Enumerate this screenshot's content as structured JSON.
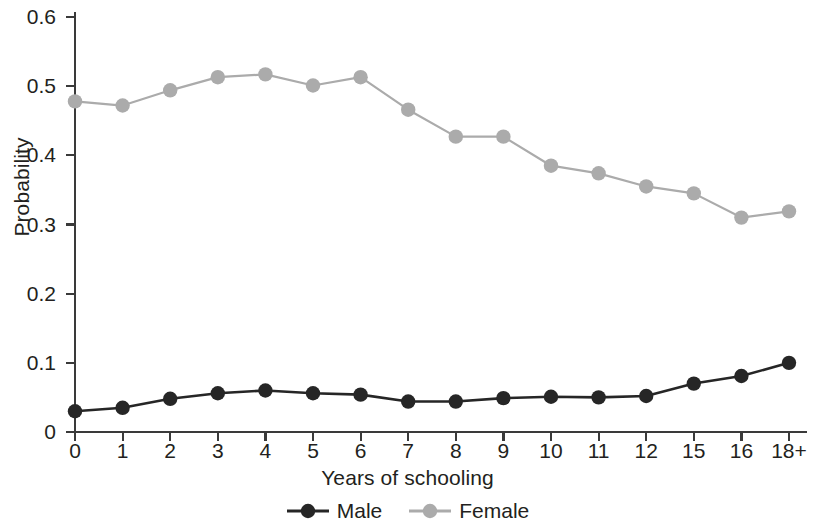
{
  "chart_data": {
    "type": "line",
    "title": "",
    "xlabel": "Years of schooling",
    "ylabel": "Probability",
    "categories": [
      "0",
      "1",
      "2",
      "3",
      "4",
      "5",
      "6",
      "7",
      "8",
      "9",
      "10",
      "11",
      "12",
      "15",
      "16",
      "18+"
    ],
    "ylim": [
      0,
      0.6
    ],
    "yticks": [
      0,
      0.1,
      0.2,
      0.3,
      0.4,
      0.5,
      0.6
    ],
    "ytick_labels": [
      "0",
      "0.1",
      "0.2",
      "0.3",
      "0.4",
      "0.5",
      "0.6"
    ],
    "grid": false,
    "legend_position": "bottom",
    "series": [
      {
        "name": "Male",
        "color": "#262626",
        "marker": "circle",
        "values": [
          0.03,
          0.035,
          0.048,
          0.056,
          0.06,
          0.056,
          0.054,
          0.044,
          0.044,
          0.049,
          0.051,
          0.05,
          0.052,
          0.07,
          0.081,
          0.1
        ]
      },
      {
        "name": "Female",
        "color": "#ababab",
        "marker": "circle",
        "values": [
          0.478,
          0.472,
          0.494,
          0.513,
          0.517,
          0.501,
          0.513,
          0.466,
          0.427,
          0.427,
          0.385,
          0.374,
          0.355,
          0.345,
          0.31,
          0.319
        ]
      }
    ]
  },
  "axes": {
    "x_title": "Years of schooling",
    "y_title": "Probability"
  },
  "legend": {
    "items": [
      {
        "label": "Male",
        "color": "#262626"
      },
      {
        "label": "Female",
        "color": "#ababab"
      }
    ]
  },
  "colors": {
    "male": "#262626",
    "female": "#ababab",
    "axis": "#3a3a3a",
    "text": "#231f20",
    "background": "#ffffff"
  }
}
